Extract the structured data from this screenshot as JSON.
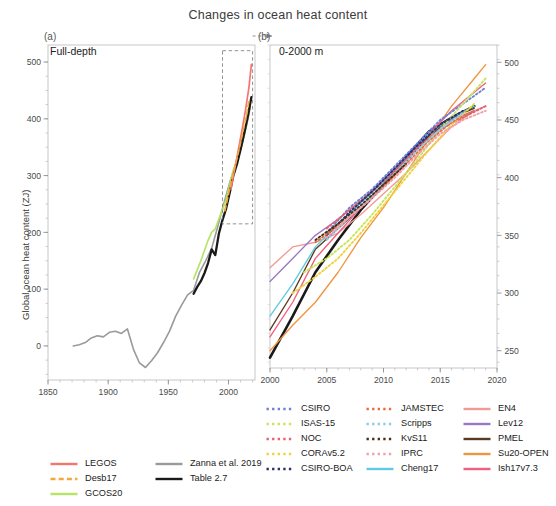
{
  "figure": {
    "title": "Changes in ocean heat content",
    "panel_a": {
      "tag": "(a)",
      "subtitle": "Full-depth",
      "ylabel": "Global ocean heat content (ZJ)",
      "xticks": [
        "1850",
        "1900",
        "1950",
        "2000"
      ],
      "yticks": [
        "0",
        "100",
        "200",
        "300",
        "400",
        "500"
      ]
    },
    "panel_b": {
      "tag": "(b)",
      "subtitle": "0-2000 m",
      "xticks": [
        "2000",
        "2005",
        "2010",
        "2015",
        "2020"
      ],
      "yticks": [
        "250",
        "300",
        "350",
        "400",
        "450",
        "500"
      ]
    }
  },
  "legend_a": [
    {
      "label": "LEGOS",
      "color": "#f3766e",
      "style": "solid"
    },
    {
      "label": "Desb17",
      "color": "#f0a93c",
      "style": "dashed"
    },
    {
      "label": "GCOS20",
      "color": "#b6e566",
      "style": "solid"
    },
    {
      "label": "Zanna et al. 2019",
      "color": "#9a9a9a",
      "style": "solid"
    },
    {
      "label": "Table 2.7",
      "color": "#1a1a1a",
      "style": "solid"
    }
  ],
  "legend_b": [
    {
      "label": "CSIRO",
      "color": "#6f7fd6",
      "style": "dotted"
    },
    {
      "label": "ISAS-15",
      "color": "#c6e55a",
      "style": "dotted"
    },
    {
      "label": "NOC",
      "color": "#e8616e",
      "style": "dotted"
    },
    {
      "label": "CORAv5.2",
      "color": "#efd23f",
      "style": "dotted"
    },
    {
      "label": "CSIRO-BOA",
      "color": "#2c2f6b",
      "style": "dotted"
    },
    {
      "label": "JAMSTEC",
      "color": "#e86c3c",
      "style": "dotted"
    },
    {
      "label": "Scripps",
      "color": "#8ecbe8",
      "style": "dotted"
    },
    {
      "label": "KvS11",
      "color": "#4a2f18",
      "style": "dotted"
    },
    {
      "label": "IPRC",
      "color": "#f0a0ad",
      "style": "dotted"
    },
    {
      "label": "Cheng17",
      "color": "#5fcbe0",
      "style": "solid"
    },
    {
      "label": "EN4",
      "color": "#f29a95",
      "style": "solid"
    },
    {
      "label": "Lev12",
      "color": "#9a78c4",
      "style": "solid"
    },
    {
      "label": "PMEL",
      "color": "#5a3a22",
      "style": "solid"
    },
    {
      "label": "Su20-OPEN",
      "color": "#f0953f",
      "style": "solid"
    },
    {
      "label": "Ish17v7.3",
      "color": "#f25f7e",
      "style": "solid"
    }
  ],
  "chart_data": [
    {
      "type": "line",
      "panel": "a",
      "title": "Changes in ocean heat content",
      "subtitle": "Full-depth",
      "xlabel": "",
      "ylabel": "Global ocean heat content (ZJ)",
      "xlim": [
        1850,
        2022
      ],
      "ylim": [
        -60,
        530
      ],
      "xticks": [
        1850,
        1900,
        1950,
        2000
      ],
      "yticks": [
        0,
        100,
        200,
        300,
        400,
        500
      ],
      "grid": false,
      "inset_box": {
        "x0": 1995,
        "x1": 2020,
        "y0": 215,
        "y1": 520,
        "style": "dashed",
        "points_to": "panel b"
      },
      "series": [
        {
          "name": "Zanna et al. 2019",
          "color": "#9a9a9a",
          "style": "solid",
          "x": [
            1871,
            1876,
            1881,
            1886,
            1891,
            1896,
            1901,
            1906,
            1911,
            1916,
            1921,
            1926,
            1931,
            1936,
            1941,
            1946,
            1951,
            1956,
            1961,
            1966,
            1971,
            1976,
            1981,
            1986,
            1991,
            1996,
            2001,
            2006,
            2011,
            2016,
            2018
          ],
          "y": [
            0,
            2,
            6,
            14,
            18,
            16,
            24,
            26,
            22,
            30,
            -6,
            -30,
            -38,
            -26,
            -12,
            6,
            26,
            52,
            72,
            90,
            98,
            130,
            150,
            172,
            210,
            250,
            288,
            320,
            352,
            398,
            420
          ]
        },
        {
          "name": "GCOS20",
          "color": "#b6e566",
          "style": "solid",
          "x": [
            1971,
            1974,
            1977,
            1980,
            1983,
            1986,
            1989,
            1992,
            1995,
            1998,
            2001,
            2004,
            2007,
            2010,
            2013,
            2016,
            2018
          ],
          "y": [
            118,
            134,
            150,
            168,
            186,
            200,
            206,
            224,
            240,
            258,
            284,
            310,
            326,
            348,
            374,
            404,
            424
          ]
        },
        {
          "name": "Table 2.7",
          "color": "#1a1a1a",
          "style": "solid",
          "x": [
            1971,
            1974,
            1977,
            1980,
            1983,
            1986,
            1989,
            1992,
            1995,
            1998,
            2001,
            2004,
            2007,
            2010,
            2013,
            2016,
            2019
          ],
          "y": [
            92,
            104,
            114,
            128,
            146,
            170,
            160,
            198,
            222,
            242,
            270,
            300,
            320,
            346,
            374,
            404,
            438
          ]
        },
        {
          "name": "LEGOS",
          "color": "#f3766e",
          "style": "solid",
          "x": [
            2002,
            2005,
            2008,
            2011,
            2014,
            2017,
            2019
          ],
          "y": [
            276,
            310,
            344,
            378,
            414,
            456,
            496
          ]
        },
        {
          "name": "Desb17",
          "color": "#f0a93c",
          "style": "dashed",
          "x": [
            1997,
            2000,
            2003,
            2006,
            2009,
            2012,
            2015,
            2017
          ],
          "y": [
            238,
            268,
            296,
            322,
            348,
            378,
            406,
            432
          ]
        }
      ]
    },
    {
      "type": "line",
      "panel": "b",
      "subtitle": "0-2000 m",
      "xlabel": "",
      "ylabel": "",
      "xlim": [
        2000,
        2020
      ],
      "ylim": [
        235,
        515
      ],
      "xticks": [
        2000,
        2005,
        2010,
        2015,
        2020
      ],
      "yticks": [
        250,
        300,
        350,
        400,
        450,
        500
      ],
      "ytick_side": "right",
      "grid": false,
      "series": [
        {
          "name": "Table 2.7",
          "color": "#1a1a1a",
          "style": "solid",
          "x": [
            2000,
            2002,
            2004,
            2006,
            2008,
            2010,
            2012,
            2014,
            2016,
            2018
          ],
          "y": [
            244,
            280,
            318,
            346,
            372,
            394,
            418,
            440,
            452,
            462
          ]
        },
        {
          "name": "EN4",
          "color": "#f29a95",
          "style": "solid",
          "x": [
            2000,
            2002,
            2004,
            2006,
            2008,
            2010,
            2012,
            2014,
            2016,
            2018,
            2019
          ],
          "y": [
            322,
            340,
            344,
            352,
            368,
            386,
            404,
            424,
            444,
            458,
            462
          ]
        },
        {
          "name": "Lev12",
          "color": "#9a78c4",
          "style": "solid",
          "x": [
            2000,
            2002,
            2004,
            2006,
            2008,
            2010,
            2012,
            2014,
            2016,
            2018
          ],
          "y": [
            310,
            330,
            350,
            364,
            380,
            398,
            418,
            436,
            450,
            458
          ]
        },
        {
          "name": "PMEL",
          "color": "#5a3a22",
          "style": "solid",
          "x": [
            2000,
            2002,
            2004,
            2006,
            2008,
            2010,
            2012,
            2014,
            2016,
            2018
          ],
          "y": [
            268,
            300,
            338,
            356,
            374,
            392,
            414,
            436,
            452,
            460
          ]
        },
        {
          "name": "Su20-OPEN",
          "color": "#f0953f",
          "style": "solid",
          "x": [
            2000,
            2002,
            2004,
            2006,
            2008,
            2010,
            2012,
            2014,
            2016,
            2018,
            2019
          ],
          "y": [
            250,
            272,
            292,
            318,
            348,
            374,
            404,
            434,
            462,
            486,
            498
          ]
        },
        {
          "name": "Ish17v7.3",
          "color": "#f25f7e",
          "style": "solid",
          "x": [
            2000,
            2002,
            2004,
            2006,
            2008,
            2010,
            2012,
            2014,
            2016,
            2018,
            2019
          ],
          "y": [
            262,
            292,
            330,
            352,
            374,
            394,
            416,
            438,
            458,
            474,
            482
          ]
        },
        {
          "name": "Cheng17",
          "color": "#5fcbe0",
          "style": "solid",
          "x": [
            2000,
            2002,
            2004,
            2006,
            2008,
            2010,
            2012,
            2014,
            2016,
            2018
          ],
          "y": [
            280,
            308,
            340,
            360,
            378,
            396,
            418,
            438,
            452,
            462
          ]
        },
        {
          "name": "CSIRO",
          "color": "#6f7fd6",
          "style": "dotted",
          "x": [
            2005,
            2007,
            2009,
            2011,
            2013,
            2015,
            2017,
            2019
          ],
          "y": [
            352,
            374,
            390,
            410,
            430,
            450,
            464,
            478
          ]
        },
        {
          "name": "ISAS-15",
          "color": "#c6e55a",
          "style": "dotted",
          "x": [
            2003,
            2005,
            2007,
            2009,
            2011,
            2013,
            2015,
            2017,
            2019
          ],
          "y": [
            318,
            330,
            346,
            368,
            392,
            416,
            442,
            464,
            486
          ]
        },
        {
          "name": "NOC",
          "color": "#e8616e",
          "style": "dotted",
          "x": [
            2005,
            2007,
            2009,
            2011,
            2013,
            2015,
            2017,
            2019
          ],
          "y": [
            356,
            372,
            388,
            406,
            426,
            442,
            452,
            462
          ]
        },
        {
          "name": "CORAv5.2",
          "color": "#efd23f",
          "style": "dotted",
          "x": [
            2002,
            2004,
            2006,
            2008,
            2010,
            2012,
            2014,
            2016,
            2018
          ],
          "y": [
            300,
            314,
            330,
            352,
            376,
            400,
            424,
            446,
            464
          ]
        },
        {
          "name": "CSIRO-BOA",
          "color": "#2c2f6b",
          "style": "dotted",
          "x": [
            2005,
            2007,
            2009,
            2011,
            2013,
            2015,
            2017
          ],
          "y": [
            350,
            370,
            388,
            408,
            428,
            446,
            458
          ]
        },
        {
          "name": "JAMSTEC",
          "color": "#e86c3c",
          "style": "dotted",
          "x": [
            2004,
            2006,
            2008,
            2010,
            2012,
            2014,
            2016,
            2018
          ],
          "y": [
            344,
            358,
            374,
            392,
            412,
            432,
            448,
            458
          ]
        },
        {
          "name": "Scripps",
          "color": "#8ecbe8",
          "style": "dotted",
          "x": [
            2005,
            2007,
            2009,
            2011,
            2013,
            2015,
            2017
          ],
          "y": [
            346,
            366,
            384,
            404,
            424,
            442,
            456
          ]
        },
        {
          "name": "KvS11",
          "color": "#4a2f18",
          "style": "dotted",
          "x": [
            2004,
            2006,
            2008,
            2010,
            2012
          ],
          "y": [
            346,
            360,
            376,
            394,
            412
          ]
        },
        {
          "name": "IPRC",
          "color": "#f0a0ad",
          "style": "dotted",
          "x": [
            2005,
            2007,
            2009,
            2011,
            2013,
            2015,
            2017,
            2019
          ],
          "y": [
            348,
            366,
            382,
            400,
            420,
            438,
            450,
            458
          ]
        }
      ]
    }
  ]
}
